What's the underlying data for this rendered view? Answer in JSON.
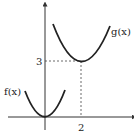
{
  "diagram": {
    "type": "function-graph",
    "curves": [
      {
        "name": "f",
        "label": "f(x)",
        "vertex": [
          0,
          0
        ],
        "shape": "upward parabola"
      },
      {
        "name": "g",
        "label": "g(x)",
        "vertex": [
          2,
          3
        ],
        "shape": "upward parabola"
      }
    ],
    "annotations": {
      "x_tick": "2",
      "y_tick": "3"
    },
    "colors": {
      "curve": "#222222",
      "axis": "#333333",
      "dash": "#444444"
    }
  }
}
